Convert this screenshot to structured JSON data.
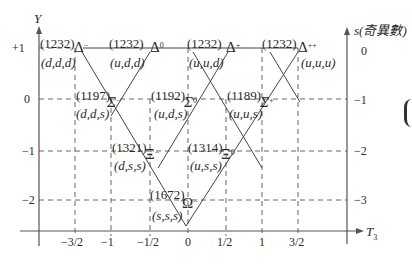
{
  "diagram": {
    "axes": {
      "y_axis_label": "Y",
      "x_axis_label": "T",
      "x_axis_subscript": "3",
      "s_axis_label": "s(奇異數)",
      "y_ticks": [
        "+1",
        "0",
        "−1",
        "−2"
      ],
      "s_ticks": [
        "0",
        "−1",
        "−2",
        "−3"
      ],
      "x_ticks": [
        "−3/2",
        "−1",
        "−1/2",
        "0",
        "1/2",
        "1",
        "3/2"
      ]
    },
    "particles": [
      {
        "name": "Δ",
        "charge": "−",
        "mass": "(1232)",
        "quarks": "(d,d,d)"
      },
      {
        "name": "Δ",
        "charge": "0",
        "mass": "(1232)",
        "quarks": "(u,d,d)"
      },
      {
        "name": "Δ",
        "charge": "+",
        "mass": "(1232)",
        "quarks": "(u,u,d)"
      },
      {
        "name": "Δ",
        "charge": "++",
        "mass": "(1232)",
        "quarks": "(u,u,u)"
      },
      {
        "name": "Σ",
        "charge": "−",
        "mass": "(1197)",
        "quarks": "(d,d,s)"
      },
      {
        "name": "Σ",
        "charge": "0",
        "mass": "(1192)",
        "quarks": "(u,d,s)"
      },
      {
        "name": "Σ",
        "charge": "+",
        "mass": "(1189)",
        "quarks": "(u,u,s)"
      },
      {
        "name": "Ξ",
        "charge": "−",
        "mass": "(1321)",
        "quarks": "(d,s,s)"
      },
      {
        "name": "Ξ",
        "charge": "0",
        "mass": "(1314)",
        "quarks": "(u,s,s)"
      },
      {
        "name": "Ω",
        "charge": "−",
        "mass": "(1672)",
        "quarks": "(s,s,s)"
      }
    ]
  }
}
